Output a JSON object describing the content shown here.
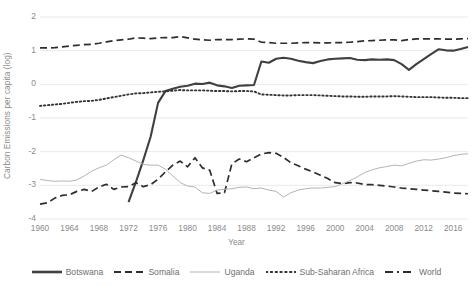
{
  "chart_data": {
    "type": "line",
    "title": "",
    "xlabel": "Year",
    "ylabel": "Carbon Emissions per capita (log)",
    "xlim": [
      1960,
      2018
    ],
    "ylim": [
      -4,
      2
    ],
    "grid": true,
    "legend_position": "bottom",
    "yticks": [
      "2",
      "1",
      "0",
      "-1",
      "-2",
      "-3",
      "-4"
    ],
    "ytick_values": [
      2,
      1,
      0,
      -1,
      -2,
      -3,
      -4
    ],
    "xticks": [
      "1960",
      "1964",
      "1968",
      "1972",
      "1976",
      "1980",
      "1984",
      "1988",
      "1992",
      "1996",
      "2000",
      "2004",
      "2008",
      "2012",
      "2016"
    ],
    "xtick_values": [
      1960,
      1964,
      1968,
      1972,
      1976,
      1980,
      1984,
      1988,
      1992,
      1996,
      2000,
      2004,
      2008,
      2012,
      2016
    ],
    "x": [
      1960,
      1961,
      1962,
      1963,
      1964,
      1965,
      1966,
      1967,
      1968,
      1969,
      1970,
      1971,
      1972,
      1973,
      1974,
      1975,
      1976,
      1977,
      1978,
      1979,
      1980,
      1981,
      1982,
      1983,
      1984,
      1985,
      1986,
      1987,
      1988,
      1989,
      1990,
      1991,
      1992,
      1993,
      1994,
      1995,
      1996,
      1997,
      1998,
      1999,
      2000,
      2001,
      2002,
      2003,
      2004,
      2005,
      2006,
      2007,
      2008,
      2009,
      2010,
      2011,
      2012,
      2013,
      2014,
      2015,
      2016,
      2017,
      2018
    ],
    "series": [
      {
        "name": "Botswana",
        "color": "#404040",
        "style": "solid-thick",
        "values": [
          null,
          null,
          null,
          null,
          null,
          null,
          null,
          null,
          null,
          null,
          null,
          null,
          -3.5,
          -2.9,
          -2.25,
          -1.55,
          -0.55,
          -0.2,
          -0.13,
          -0.07,
          -0.04,
          0.02,
          0.01,
          0.05,
          -0.03,
          -0.06,
          -0.11,
          -0.04,
          -0.03,
          -0.02,
          0.68,
          0.64,
          0.76,
          0.79,
          0.76,
          0.7,
          0.66,
          0.63,
          0.69,
          0.74,
          0.76,
          0.77,
          0.78,
          0.73,
          0.72,
          0.74,
          0.73,
          0.74,
          0.72,
          0.6,
          0.43,
          0.6,
          0.75,
          0.9,
          1.04,
          1.01,
          1.0,
          1.05,
          1.11
        ]
      },
      {
        "name": "Somalia",
        "color": "#2e2e2e",
        "style": "dashed",
        "values": [
          -3.56,
          -3.52,
          -3.38,
          -3.3,
          -3.28,
          -3.18,
          -3.12,
          -3.18,
          -3.05,
          -2.97,
          -3.12,
          -3.05,
          -3.04,
          -2.92,
          -3.04,
          -2.98,
          -2.82,
          -2.6,
          -2.4,
          -2.28,
          -2.45,
          -2.18,
          -2.48,
          -2.55,
          -3.24,
          -3.22,
          -2.36,
          -2.22,
          -2.3,
          -2.18,
          -2.07,
          -2.03,
          -2.05,
          -2.17,
          -2.33,
          -2.42,
          -2.52,
          -2.6,
          -2.7,
          -2.8,
          -2.92,
          -2.95,
          -2.92,
          -2.93,
          -2.98,
          -2.98,
          -3.0,
          -3.02,
          -3.05,
          -3.08,
          -3.1,
          -3.12,
          -3.14,
          -3.16,
          -3.18,
          -3.2,
          -3.23,
          -3.24,
          -3.25
        ]
      },
      {
        "name": "Uganda",
        "color": "#b4b4b4",
        "style": "solid-thin",
        "values": [
          -2.82,
          -2.86,
          -2.88,
          -2.87,
          -2.88,
          -2.84,
          -2.72,
          -2.58,
          -2.48,
          -2.4,
          -2.24,
          -2.1,
          -2.18,
          -2.28,
          -2.38,
          -2.4,
          -2.4,
          -2.52,
          -2.72,
          -2.92,
          -3.02,
          -3.05,
          -3.22,
          -3.24,
          -3.14,
          -3.12,
          -3.1,
          -3.06,
          -3.05,
          -3.1,
          -3.08,
          -3.14,
          -3.18,
          -3.35,
          -3.22,
          -3.14,
          -3.1,
          -3.08,
          -3.08,
          -3.06,
          -3.04,
          -2.95,
          -2.86,
          -2.75,
          -2.62,
          -2.54,
          -2.48,
          -2.44,
          -2.4,
          -2.42,
          -2.35,
          -2.28,
          -2.24,
          -2.25,
          -2.22,
          -2.18,
          -2.12,
          -2.08,
          -2.06
        ]
      },
      {
        "name": "Sub-Saharan Africa",
        "color": "#333333",
        "style": "dotted",
        "values": [
          -0.64,
          -0.62,
          -0.6,
          -0.58,
          -0.55,
          -0.52,
          -0.5,
          -0.49,
          -0.46,
          -0.42,
          -0.38,
          -0.34,
          -0.3,
          -0.27,
          -0.26,
          -0.24,
          -0.22,
          -0.21,
          -0.19,
          -0.17,
          -0.18,
          -0.18,
          -0.18,
          -0.19,
          -0.2,
          -0.2,
          -0.21,
          -0.2,
          -0.2,
          -0.21,
          -0.3,
          -0.31,
          -0.32,
          -0.33,
          -0.33,
          -0.32,
          -0.32,
          -0.32,
          -0.33,
          -0.34,
          -0.35,
          -0.36,
          -0.36,
          -0.37,
          -0.37,
          -0.36,
          -0.36,
          -0.36,
          -0.35,
          -0.36,
          -0.37,
          -0.38,
          -0.38,
          -0.38,
          -0.39,
          -0.4,
          -0.4,
          -0.41,
          -0.41
        ]
      },
      {
        "name": "World",
        "color": "#2e2e2e",
        "style": "dashed",
        "values": [
          1.08,
          1.08,
          1.09,
          1.11,
          1.14,
          1.16,
          1.18,
          1.19,
          1.22,
          1.26,
          1.3,
          1.32,
          1.34,
          1.38,
          1.37,
          1.36,
          1.38,
          1.39,
          1.39,
          1.42,
          1.38,
          1.34,
          1.32,
          1.31,
          1.33,
          1.33,
          1.33,
          1.34,
          1.35,
          1.34,
          1.25,
          1.24,
          1.22,
          1.22,
          1.22,
          1.23,
          1.24,
          1.24,
          1.23,
          1.23,
          1.24,
          1.24,
          1.25,
          1.27,
          1.29,
          1.3,
          1.31,
          1.32,
          1.32,
          1.3,
          1.33,
          1.35,
          1.35,
          1.35,
          1.35,
          1.34,
          1.34,
          1.35,
          1.36
        ]
      }
    ]
  },
  "legend": {
    "items": [
      {
        "label": "Botswana",
        "swatch": "line-solid-thick-dark"
      },
      {
        "label": "Somalia",
        "swatch": "line-dashed-dark"
      },
      {
        "label": "Uganda",
        "swatch": "line-solid-thin-gray"
      },
      {
        "label": "Sub-Saharan Africa",
        "swatch": "line-dotted-dark"
      },
      {
        "label": "World",
        "swatch": "line-dashdot-dark"
      }
    ]
  },
  "colors": {
    "botswana": "#404040",
    "somalia": "#2e2e2e",
    "uganda": "#b4b4b4",
    "subsaharan": "#333333",
    "world": "#2e2e2e",
    "grid": "#e6e6e6",
    "text": "#8a8a8a"
  }
}
